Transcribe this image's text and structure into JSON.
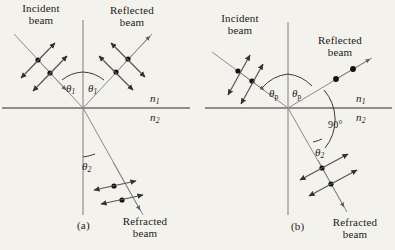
{
  "figure": {
    "kind": "optics-diagram",
    "background_color": "#f4f2ec",
    "ink_color": "#1a1a1a",
    "ray_color": "#6b6b6b"
  },
  "panels": [
    {
      "id": "a",
      "caption": "(a)",
      "caption_pos": {
        "x": 78,
        "y": 221
      },
      "labels": {
        "incident_beam": "Incident\nbeam",
        "reflected_beam": "Reflected\nbeam",
        "refracted_beam": "Refracted\nbeam",
        "angle_incidence": "θ₁",
        "angle_reflection": "θ₁",
        "angle_refraction": "θ₂",
        "index_upper": "n₁",
        "index_lower": "n₂"
      },
      "label_positions": {
        "incident_beam": {
          "x": 4,
          "y": 4
        },
        "reflected_beam": {
          "x": 96,
          "y": 6
        },
        "refracted_beam": {
          "x": 110,
          "y": 218
        },
        "angle_incidence": {
          "x": 70,
          "y": 84
        },
        "angle_reflection": {
          "x": 92,
          "y": 84
        },
        "angle_refraction": {
          "x": 84,
          "y": 162
        },
        "index_upper": {
          "x": 152,
          "y": 96
        },
        "index_lower": {
          "x": 152,
          "y": 117
        }
      }
    },
    {
      "id": "b",
      "caption": "(b)",
      "caption_pos": {
        "x": 292,
        "y": 222
      },
      "labels": {
        "incident_beam": "Incident\nbeam",
        "reflected_beam": "Reflected\nbeam",
        "refracted_beam": "Refracted\nbeam",
        "angle_incidence": "θp",
        "angle_reflection": "θp",
        "angle_refraction": "θ₂",
        "angle_between": "90°",
        "index_upper": "n₁",
        "index_lower": "n₂"
      },
      "label_positions": {
        "incident_beam": {
          "x": 207,
          "y": 14
        },
        "reflected_beam": {
          "x": 304,
          "y": 36
        },
        "refracted_beam": {
          "x": 320,
          "y": 219
        },
        "angle_incidence": {
          "x": 273,
          "y": 89
        },
        "angle_reflection": {
          "x": 295,
          "y": 89
        },
        "angle_refraction": {
          "x": 317,
          "y": 148
        },
        "angle_between": {
          "x": 330,
          "y": 125
        },
        "index_upper": {
          "x": 358,
          "y": 96
        },
        "index_lower": {
          "x": 358,
          "y": 117
        }
      }
    }
  ],
  "physics": {
    "panel_a": {
      "incident_polarization": "unpolarized (dots + double arrows)",
      "reflected_polarization": "partially polarized (dots + double arrows)",
      "refracted_polarization": "partially polarized (dots + double arrows)",
      "dots_per_ray": 2
    },
    "panel_b": {
      "incident_polarization": "unpolarized (dots + double arrows)",
      "reflected_polarization": "fully polarized perpendicular to page (dots only)",
      "refracted_polarization": "partially polarized (dots + double arrows)",
      "reflected_refracted_angle_deg": 90,
      "dots_per_ray": 2
    }
  }
}
